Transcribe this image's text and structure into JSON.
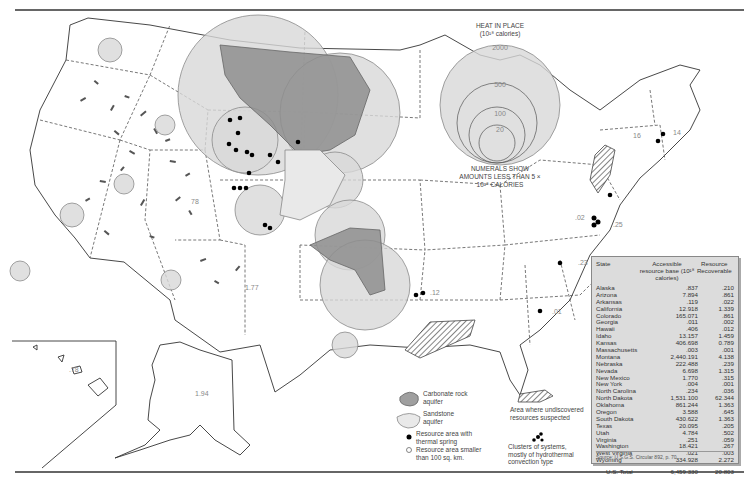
{
  "map": {
    "heat_legend": {
      "title": "HEAT IN PLACE",
      "unit": "(10¹⁸ calories)",
      "rings": [
        "2000",
        "500",
        "100",
        "20"
      ]
    },
    "numerals_note": "NUMERALS SHOW AMOUNTS LESS THAN 5 × 10¹⁸ CALORIES",
    "value_labels": [
      {
        "id": "nevada",
        "text": "78"
      },
      {
        "id": "arizona",
        "text": "1.77"
      },
      {
        "id": "hawaii",
        "text": ".78"
      },
      {
        "id": "alaska",
        "text": "1.94"
      },
      {
        "id": "new-york",
        "text": "16"
      },
      {
        "id": "massachusetts",
        "text": "14"
      },
      {
        "id": "west-virginia",
        "text": ".02"
      },
      {
        "id": "virginia",
        "text": ".25"
      },
      {
        "id": "north-carolina",
        "text": ".23"
      },
      {
        "id": "georgia",
        "text": ".01"
      },
      {
        "id": "arkansas",
        "text": ".12"
      }
    ]
  },
  "legend": {
    "carbonate": "Carbonate rock aquifer",
    "sandstone": "Sandstone aquifer",
    "thermal_spring": "Resource area with thermal spring",
    "small_area": "Resource area smaller than 100 sq. km.",
    "undiscovered": "Area where undiscovered resources suspected",
    "clusters": "Clusters of systems, mostly of hydrothermal convection type"
  },
  "table": {
    "headers": {
      "state": "State",
      "accessible": "Accessible resource base (10¹⁸ calories)",
      "recoverable": "Resource Recoverable"
    },
    "rows": [
      {
        "state": "Alaska",
        "accessible": ".837",
        "recoverable": ".210"
      },
      {
        "state": "Arizona",
        "accessible": "7.894",
        "recoverable": ".861"
      },
      {
        "state": "Arkansas",
        "accessible": ".119",
        "recoverable": ".022"
      },
      {
        "state": "California",
        "accessible": "12.918",
        "recoverable": "1.339"
      },
      {
        "state": "Colorado",
        "accessible": "165.071",
        "recoverable": ".861"
      },
      {
        "state": "Georgia",
        "accessible": ".011",
        "recoverable": ".002"
      },
      {
        "state": "Hawaii",
        "accessible": ".406",
        "recoverable": ".012"
      },
      {
        "state": "Idaho",
        "accessible": "13.157",
        "recoverable": "1.459"
      },
      {
        "state": "Kansas",
        "accessible": "406.698",
        "recoverable": "0.789"
      },
      {
        "state": "Massachusetts",
        "accessible": ".003",
        "recoverable": ".001"
      },
      {
        "state": "Montana",
        "accessible": "2,440.191",
        "recoverable": "4.138"
      },
      {
        "state": "Nebraska",
        "accessible": "222.488",
        "recoverable": ".239"
      },
      {
        "state": "Nevada",
        "accessible": "6.698",
        "recoverable": "1.315"
      },
      {
        "state": "New Mexico",
        "accessible": "1.770",
        "recoverable": ".315"
      },
      {
        "state": "New York",
        "accessible": ".004",
        "recoverable": ".001"
      },
      {
        "state": "North Carolina",
        "accessible": ".234",
        "recoverable": ".036"
      },
      {
        "state": "North Dakota",
        "accessible": "1,531.100",
        "recoverable": "62.344"
      },
      {
        "state": "Oklahoma",
        "accessible": "861.244",
        "recoverable": "1.363"
      },
      {
        "state": "Oregon",
        "accessible": "3.588",
        "recoverable": ".645"
      },
      {
        "state": "South Dakota",
        "accessible": "430.622",
        "recoverable": "1.363"
      },
      {
        "state": "Texas",
        "accessible": "20.095",
        "recoverable": ".205"
      },
      {
        "state": "Utah",
        "accessible": "4.784",
        "recoverable": ".502"
      },
      {
        "state": "Virginia",
        "accessible": ".251",
        "recoverable": ".059"
      },
      {
        "state": "Washington",
        "accessible": "18.421",
        "recoverable": ".267"
      },
      {
        "state": "West Virginia",
        "accessible": ".021",
        "recoverable": ".003"
      },
      {
        "state": "Wyoming",
        "accessible": "334.928",
        "recoverable": "2.272"
      }
    ],
    "total": {
      "label": "U.S. Total",
      "accessible": "6,459.330",
      "recoverable": "20.803"
    },
    "source": "Source: U.S.G.S. Circular 892, p. 70"
  }
}
